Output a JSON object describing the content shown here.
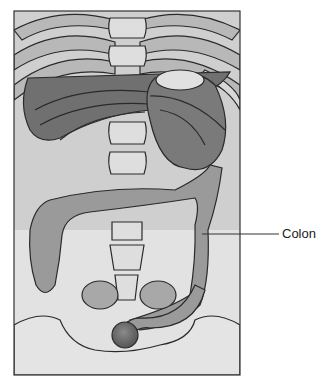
{
  "figure": {
    "labels": [
      {
        "text": "Colon",
        "target": "colon"
      }
    ]
  },
  "colors": {
    "outline": "#2a2a2a",
    "background": "#c8c8c8",
    "bone": "#dcdcdc",
    "organ_dark": "#6e6e6e",
    "organ_mid": "#8c8c8c",
    "colon": "#9a9a9a",
    "rectum": "#6a6a6a"
  }
}
